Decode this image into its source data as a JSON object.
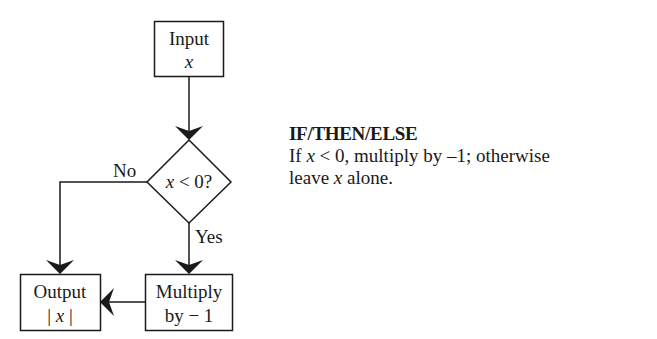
{
  "diagram": {
    "type": "flowchart",
    "nodes": {
      "input": {
        "shape": "rectangle",
        "line1": "Input",
        "line2": "x"
      },
      "decision": {
        "shape": "diamond",
        "var": "x",
        "rest": " < 0?"
      },
      "multiply": {
        "shape": "rectangle",
        "line1": "Multiply",
        "line2": "by − 1"
      },
      "output": {
        "shape": "rectangle",
        "line1": "Output",
        "line2_pre": "| ",
        "line2_var": "x",
        "line2_post": " |"
      }
    },
    "edges": {
      "no_label": "No",
      "yes_label": "Yes"
    },
    "colors": {
      "stroke": "#1a1a1a",
      "background": "#ffffff"
    }
  },
  "caption": {
    "title": "IF/THEN/ELSE",
    "body_part1": "If ",
    "body_var1": "x",
    "body_part2": " < 0, multiply by –1; otherwise",
    "body_part3": "leave ",
    "body_var2": "x",
    "body_part4": " alone."
  }
}
